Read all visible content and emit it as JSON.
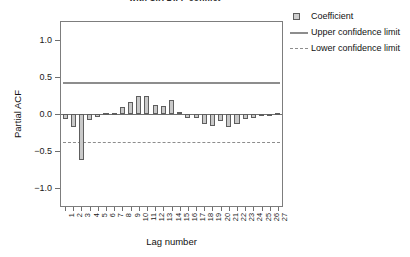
{
  "chart_data": {
    "type": "bar",
    "title": "with SIX DIFF conflict",
    "xlabel": "Lag number",
    "ylabel": "Partial ACF",
    "ylim": [
      -1.25,
      1.25
    ],
    "yticks": [
      "1.0",
      "0.5",
      "0.0",
      "-0.5",
      "-1.0"
    ],
    "ytick_values": [
      1.0,
      0.5,
      0.0,
      -0.5,
      -1.0
    ],
    "grid": false,
    "legend_position": "right",
    "upper_confidence_limit": 0.43,
    "lower_confidence_limit": -0.38,
    "categories": [
      1,
      2,
      3,
      4,
      5,
      6,
      7,
      8,
      9,
      10,
      11,
      12,
      13,
      14,
      15,
      16,
      17,
      18,
      19,
      20,
      21,
      22,
      23,
      24,
      25,
      26,
      27
    ],
    "series": [
      {
        "name": "Coefficient",
        "values": [
          -0.07,
          -0.18,
          -0.62,
          -0.08,
          -0.04,
          0.01,
          0.02,
          0.09,
          0.16,
          0.25,
          0.24,
          0.12,
          0.11,
          0.19,
          0.03,
          -0.05,
          -0.06,
          -0.13,
          -0.16,
          -0.09,
          -0.17,
          -0.13,
          -0.07,
          -0.05,
          -0.03,
          -0.02,
          0.01
        ]
      }
    ],
    "extra_positive_bars": [
      0.07,
      0.08,
      0.05
    ]
  },
  "legend": {
    "items": [
      {
        "label": "Coefficient",
        "key": "square"
      },
      {
        "label": "Upper confidence limit",
        "key": "solid-line"
      },
      {
        "label": "Lower confidence limit",
        "key": "dashed-line"
      }
    ]
  },
  "colors": {
    "bar_fill": "#c9c9c9",
    "bar_stroke": "#5e5e5e",
    "confidence_line": "#8d8d8d",
    "axis": "#6f6f6f"
  }
}
